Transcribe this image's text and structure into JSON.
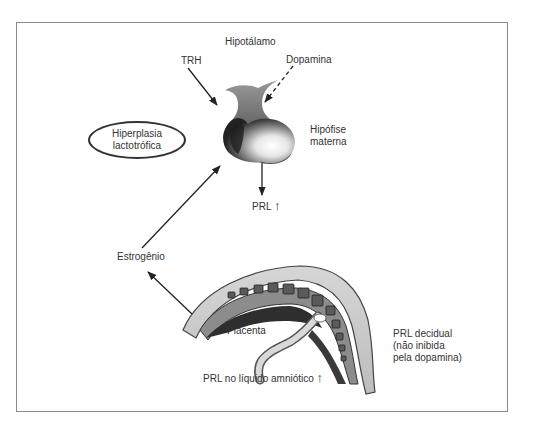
{
  "diagram": {
    "labels": {
      "hypothalamus": "Hipotálamo",
      "trh": "TRH",
      "dopamine": "Dopamina",
      "pituitary_line1": "Hipófise",
      "pituitary_line2": "materna",
      "hyperplasia_line1": "Hiperplasia",
      "hyperplasia_line2": "lactotrófica",
      "prl": "PRL",
      "up_arrow": "↑",
      "estrogen": "Estrogênio",
      "placenta": "Placenta",
      "decidual_line1": "PRL decidual",
      "decidual_line2": "(não inibida",
      "decidual_line3": "pela dopamina)",
      "amniotic": "PRL no líquido amniótico"
    },
    "connections": [
      {
        "from": "TRH",
        "to": "Hipófise materna",
        "style": "solid"
      },
      {
        "from": "Dopamina",
        "to": "Hipófise materna",
        "style": "dashed"
      },
      {
        "from": "Hipófise materna",
        "to": "PRL",
        "style": "solid"
      },
      {
        "from": "Placenta",
        "to": "Estrogênio",
        "style": "solid"
      },
      {
        "from": "Estrogênio",
        "to": "Hipófise materna",
        "style": "solid"
      }
    ]
  }
}
